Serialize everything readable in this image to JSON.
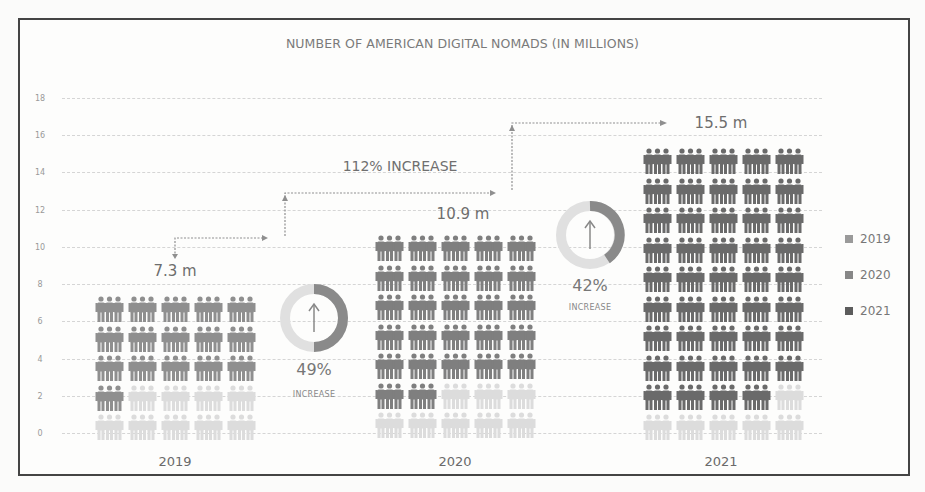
{
  "chart_data": {
    "type": "bar",
    "style": "pictogram",
    "title": "NUMBER OF AMERICAN DIGITAL NOMADS (IN MILLIONS)",
    "xlabel": "",
    "ylabel": "",
    "categories": [
      "2019",
      "2020",
      "2021"
    ],
    "values": [
      7.3,
      10.9,
      15.5
    ],
    "value_labels": [
      "7.3 m",
      "10.9 m",
      "15.5 m"
    ],
    "ylim": [
      0,
      18
    ],
    "yticks": [
      0,
      2,
      4,
      6,
      8,
      10,
      12,
      14,
      16,
      18
    ],
    "grid": true,
    "legend": {
      "position": "right",
      "entries": [
        "2019",
        "2020",
        "2021"
      ]
    },
    "annotations": [
      {
        "text": "49% INCREASE",
        "from": "2019",
        "to": "2020"
      },
      {
        "text": "42% INCREASE",
        "from": "2020",
        "to": "2021"
      },
      {
        "text": "112% INCREASE",
        "from": "2019",
        "to": "2021"
      }
    ]
  },
  "title": "NUMBER OF AMERICAN DIGITAL NOMADS (IN MILLIONS)",
  "yticks": [
    "18",
    "16",
    "14",
    "12",
    "10",
    "8",
    "6",
    "4",
    "2",
    "0"
  ],
  "years": [
    "2019",
    "2020",
    "2021"
  ],
  "value_labels": [
    "7.3 m",
    "10.9 m",
    "15.5 m"
  ],
  "increase_1": {
    "pct": "49%",
    "label": "INCREASE"
  },
  "increase_2": {
    "pct": "42%",
    "label": "INCREASE"
  },
  "increase_total": "112% INCREASE",
  "legend": [
    {
      "label": "2019",
      "color": "#9a9a9a"
    },
    {
      "label": "2020",
      "color": "#878787"
    },
    {
      "label": "2021",
      "color": "#5c5c5c"
    }
  ],
  "colors": {
    "icon_2019": "#8f8f8f",
    "icon_2020": "#7f7f7f",
    "icon_2021": "#6a6a6a",
    "icon_light": "#dcdcdc",
    "donut_dark": "#8a8a8a",
    "donut_light": "#e2e2e2",
    "arrow": "#8a8a8a"
  },
  "groups": [
    {
      "year": "2019",
      "left": 95,
      "top": 296,
      "dark_rows": 3,
      "partial_row_dark": 1,
      "light_rows": 1,
      "color": "#8f8f8f"
    },
    {
      "year": "2020",
      "left": 375,
      "top": 235,
      "dark_rows": 5,
      "partial_row_dark": 2,
      "light_rows": 1,
      "color": "#7f7f7f"
    },
    {
      "year": "2021",
      "left": 643,
      "top": 148,
      "dark_rows": 8,
      "partial_row_dark": 4,
      "light_rows": 1,
      "color": "#6a6a6a"
    }
  ]
}
